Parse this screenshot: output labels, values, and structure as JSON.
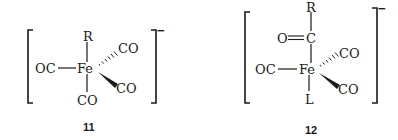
{
  "structures": [
    {
      "label": "11",
      "charge": "−",
      "center_atom": "Fe",
      "ligands": {
        "top": "R",
        "left": "OC",
        "bottom": "CO",
        "upper_right_hashed": "CO",
        "lower_right_wedge": "CO"
      }
    },
    {
      "label": "12",
      "charge": "−",
      "center_atom": "Fe",
      "acyl": {
        "substituent": "R",
        "carbon": "C",
        "oxygen": "O"
      },
      "ligands": {
        "left": "OC",
        "bottom": "L",
        "upper_right_hashed": "CO",
        "lower_right_wedge": "CO"
      }
    }
  ]
}
